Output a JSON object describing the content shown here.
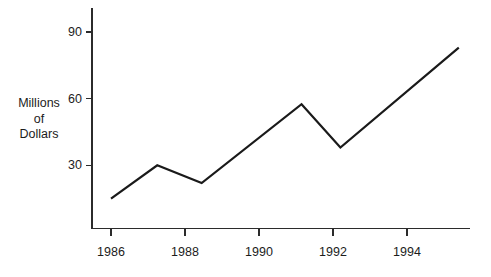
{
  "chart_data": {
    "type": "line",
    "title": "",
    "subtitle": "",
    "xlabel": "",
    "ylabel": "Millions of Dollars",
    "ylabel_lines": [
      "Millions",
      "of",
      "Dollars"
    ],
    "grid": false,
    "legend": null,
    "legend_position": "none",
    "xlim": [
      1985.5,
      1995.6
    ],
    "ylim": [
      0,
      95
    ],
    "xticks": [
      1986,
      1988,
      1990,
      1992,
      1994
    ],
    "xtick_labels": [
      "1986",
      "1988",
      "1990",
      "1992",
      "1994"
    ],
    "yticks": [
      30,
      60,
      90
    ],
    "ytick_labels": [
      "30",
      "60",
      "90"
    ],
    "series": [
      {
        "name": "Millions of Dollars",
        "color": "#1a1a1a",
        "x": [
          1986.0,
          1987.25,
          1988.45,
          1991.15,
          1992.2,
          1995.4
        ],
        "values": [
          15,
          30,
          22,
          57.5,
          38,
          83
        ]
      }
    ],
    "annotations": []
  },
  "style": {
    "axis_color": "#2b2b2b",
    "line_color": "#1a1a1a",
    "text_color": "#1c1c1c",
    "background": "#ffffff"
  }
}
